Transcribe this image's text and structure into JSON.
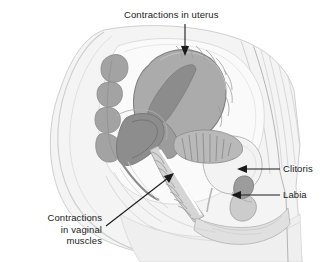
{
  "figure": {
    "width": 321,
    "height": 262,
    "background_color": "#ffffff"
  },
  "labels": {
    "uterus": {
      "text": "Contractions in uterus",
      "arrow": "down-arrow",
      "position": "top-center"
    },
    "clitoris": {
      "text": "Clitoris",
      "arrow": "left-arrow",
      "position": "right"
    },
    "labia": {
      "text": "Labia",
      "arrow": "left-arrow",
      "position": "right"
    },
    "vaginal_muscles": {
      "text": "Contractions\nin vaginal\nmuscles",
      "arrow": "up-right-arrow",
      "position": "bottom-left"
    }
  },
  "colors": {
    "body_fill": "#f2f2f2",
    "body_outline": "#bdbdbd",
    "skin_shade": "#e4e4e4",
    "organ_mid": "#a8a8a8",
    "organ_dark": "#8a8a8a",
    "organ_darker": "#6f6f6f",
    "organ_light": "#d2d2d2",
    "cavity_white": "#fbfbfb",
    "stroke": "#7d7d7d",
    "text": "#1a1a1a",
    "arrow": "#1a1a1a"
  },
  "structures": [
    {
      "name": "sacrum-vertebrae",
      "shade": "#9a9a9a"
    },
    {
      "name": "uterus",
      "shade": "#a8a8a8"
    },
    {
      "name": "uterine-cavity",
      "shade": "#8a8a8a"
    },
    {
      "name": "rectum",
      "shade": "#8a8a8a"
    },
    {
      "name": "bladder",
      "shade": "#f0f0f0"
    },
    {
      "name": "vagina",
      "shade": "#d2d2d2"
    },
    {
      "name": "clitoris",
      "shade": "#9a9a9a"
    },
    {
      "name": "labia",
      "shade": "#dcdcdc"
    },
    {
      "name": "pubic-bone",
      "shade": "#c8c8c8"
    },
    {
      "name": "abdominal-wall",
      "shade": "#ececec"
    }
  ]
}
